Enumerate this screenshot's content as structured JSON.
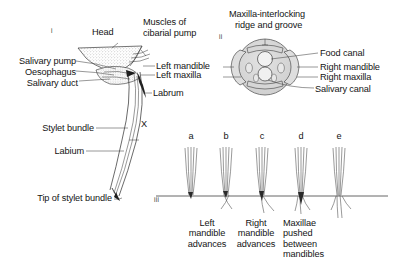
{
  "figure": {
    "background": "#ffffff",
    "ink": "#141414",
    "panels": [
      {
        "id": "i",
        "marker": "i"
      },
      {
        "id": "ii",
        "marker": "ii"
      },
      {
        "id": "iii",
        "marker": "iii"
      }
    ]
  },
  "panel_i": {
    "title_labels": {
      "head": "Head",
      "muscles": "Muscles of\ncibarial pump",
      "muscles_line1": "Muscles of",
      "muscles_line2": "cibarial pump"
    },
    "left_labels": [
      {
        "text": "Salivary pump"
      },
      {
        "text": "Oesophagus"
      },
      {
        "text": "Salivary duct"
      },
      {
        "text": "Stylet bundle"
      },
      {
        "text": "Labium"
      },
      {
        "text": "Tip of stylet bundle"
      }
    ],
    "right_labels": [
      {
        "text": "Left mandible"
      },
      {
        "text": "Left maxilla"
      },
      {
        "text": "Labrum"
      }
    ],
    "marker_x": "X"
  },
  "panel_ii": {
    "top_label_line1": "Maxilla-interlocking",
    "top_label_line2": "ridge and groove",
    "right_labels": [
      {
        "text": "Food canal"
      },
      {
        "text": "Right mandible"
      },
      {
        "text": "Right maxilla"
      },
      {
        "text": "Salivary canal"
      }
    ],
    "left_connected_labels": [
      {
        "text": "Left mandible"
      },
      {
        "text": "Left maxilla"
      }
    ]
  },
  "panel_iii": {
    "stage_letters": [
      "a",
      "b",
      "c",
      "d",
      "e"
    ],
    "captions": [
      {
        "under": "b",
        "line1": "Left",
        "line2": "mandible",
        "line3": "advances",
        "line4": ""
      },
      {
        "under": "c",
        "line1": "Right",
        "line2": "mandible",
        "line3": "advances",
        "line4": ""
      },
      {
        "under": "d",
        "line1": "Maxillae",
        "line2": "pushed",
        "line3": "between",
        "line4": "mandibles"
      }
    ]
  }
}
